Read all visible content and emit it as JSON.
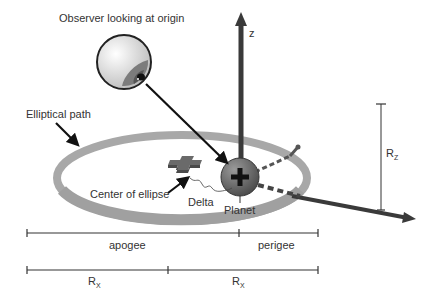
{
  "diagram": {
    "labels": {
      "observer": "Observer looking at origin",
      "elliptical_path": "Elliptical path",
      "z_axis": "z",
      "center_of_ellipse": "Center of ellipse",
      "delta": "Delta",
      "planet": "Planet",
      "rz_main": "R",
      "rz_sub": "Z",
      "apogee": "apogee",
      "perigee": "perigee",
      "rx1_main": "R",
      "rx1_sub": "X",
      "rx2_main": "R",
      "rx2_sub": "X"
    },
    "colors": {
      "ring": "#a8a8a8",
      "axis": "#3a3a3a",
      "planet": "#6e6e6e",
      "center_marker": "#5a5a5a",
      "text": "#333333"
    }
  }
}
